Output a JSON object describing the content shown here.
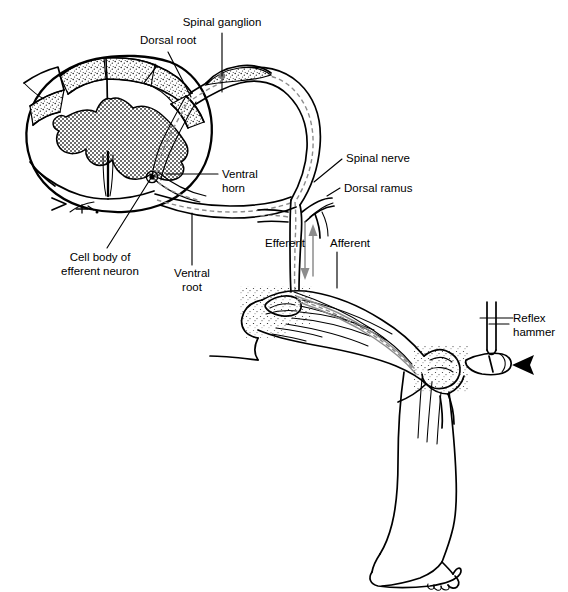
{
  "figure": {
    "type": "anatomical-line-diagram",
    "background_color": "#ffffff",
    "ink_color": "#000000",
    "nerve_color": "#8c8c8c",
    "gray_matter_fill": "#b3b3b3",
    "width": 568,
    "height": 592
  },
  "labels": {
    "dorsal_root": "Dorsal root",
    "spinal_ganglion": "Spinal ganglion",
    "ventral_horn_line1": "Ventral",
    "ventral_horn_line2": "horn",
    "cell_body_line1": "Cell body of",
    "cell_body_line2": "efferent neuron",
    "ventral_root_line1": "Ventral",
    "ventral_root_line2": "root",
    "spinal_nerve": "Spinal nerve",
    "dorsal_ramus": "Dorsal ramus",
    "efferent": "Efferent",
    "afferent": "Afferent",
    "reflex_hammer_line1": "Reflex",
    "reflex_hammer_line2": "hammer"
  },
  "structures": [
    {
      "name": "spinal-cord-cross-section",
      "label": "Spinal cord cross-section with butterfly-shaped gray matter"
    },
    {
      "name": "dorsal-root",
      "label": "Dorsal root"
    },
    {
      "name": "spinal-ganglion",
      "label": "Spinal ganglion"
    },
    {
      "name": "ventral-horn",
      "label": "Ventral horn"
    },
    {
      "name": "efferent-neuron-cell-body",
      "label": "Cell body of efferent neuron"
    },
    {
      "name": "ventral-root",
      "label": "Ventral root"
    },
    {
      "name": "spinal-nerve",
      "label": "Spinal nerve"
    },
    {
      "name": "dorsal-ramus",
      "label": "Dorsal ramus"
    },
    {
      "name": "efferent-pathway",
      "label": "Efferent (motor) pathway, arrow directed away from cord"
    },
    {
      "name": "afferent-pathway",
      "label": "Afferent (sensory) pathway, arrow directed toward cord"
    },
    {
      "name": "leg-thigh-knee",
      "label": "Flexed leg with knee, patella and quadriceps tendon"
    },
    {
      "name": "reflex-hammer",
      "label": "Reflex hammer striking the patellar tendon"
    },
    {
      "name": "strike-arrow",
      "label": "Solid arrowhead indicating hammer strike direction"
    },
    {
      "name": "lower-leg-foot",
      "label": "Lower leg and foot"
    }
  ]
}
